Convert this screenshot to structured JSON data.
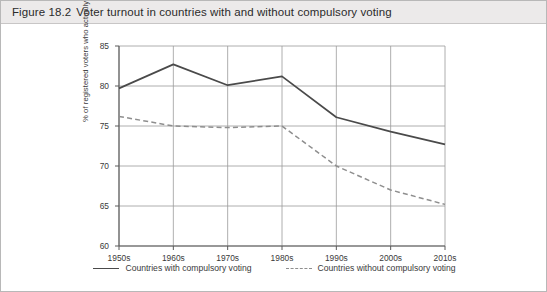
{
  "caption": {
    "figure_number": "Figure 18.2",
    "title": "Voter turnout in countries with and without compulsory voting"
  },
  "legend": {
    "series_1": "Countries with compulsory voting",
    "series_2": "Countries without compulsory voting"
  },
  "source_note": "Note: Definitions of voter turnout and compulsory voting vary. Countries are classified as having compulsory voting where it is enforced.",
  "colors": {
    "solid_line": "#4a4a4a",
    "dashed_line": "#8e8e8e",
    "grid": "#9a9a9a",
    "axis": "#5a5a5a",
    "caption_bar": "#eceaea",
    "text": "#3a3a3a"
  },
  "chart_data": {
    "type": "line",
    "title": "Voter turnout in countries with and without compulsory voting",
    "xlabel": "",
    "ylabel": "% of registered voters who actually voted",
    "categories": [
      "1950s",
      "1960s",
      "1970s",
      "1980s",
      "1990s",
      "2000s",
      "2010s"
    ],
    "ylim": [
      60,
      85
    ],
    "yticks": [
      60,
      65,
      70,
      75,
      80,
      85
    ],
    "grid": true,
    "legend_position": "bottom",
    "series": [
      {
        "name": "Countries with compulsory voting",
        "style": "solid",
        "color": "#4a4a4a",
        "values": [
          79.7,
          82.7,
          80.1,
          81.2,
          76.1,
          74.3,
          72.7
        ]
      },
      {
        "name": "Countries without compulsory voting",
        "style": "dashed",
        "color": "#8e8e8e",
        "values": [
          76.2,
          75.0,
          74.8,
          75.0,
          70.0,
          67.0,
          65.2
        ]
      }
    ]
  }
}
